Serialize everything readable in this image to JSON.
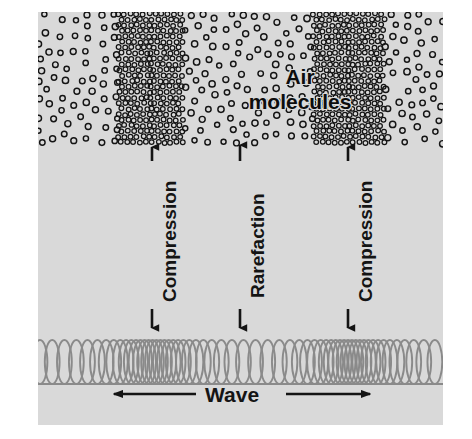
{
  "figure": {
    "background_color": "#ffffff",
    "panel_color": "#d9d9d9",
    "ink_color": "#141414",
    "coil_color": "#8a8a8a"
  },
  "labels": {
    "air": "Air",
    "molecules": "molecules",
    "compression_left": "Compression",
    "rarefaction": "Rarefaction",
    "compression_right": "Compression",
    "wave": "Wave"
  },
  "callouts": [
    {
      "name": "compression-left",
      "text": "Compression",
      "x": 152,
      "arrow_top": "up",
      "arrow_bottom": "down"
    },
    {
      "name": "rarefaction",
      "text": "Rarefaction",
      "x": 240,
      "arrow_top": "up",
      "arrow_bottom": "down"
    },
    {
      "name": "compression-right",
      "text": "Compression",
      "x": 348,
      "arrow_top": "up",
      "arrow_bottom": "down"
    }
  ],
  "chart_data": {
    "type": "diagram",
    "regions": [
      {
        "name": "rarefaction-left-edge",
        "kind": "rarefaction",
        "x_start": 0,
        "x_end": 80,
        "density": "sparse"
      },
      {
        "name": "compression-1",
        "kind": "compression",
        "x_start": 80,
        "x_end": 147,
        "density": "dense"
      },
      {
        "name": "rarefaction-center",
        "kind": "rarefaction",
        "x_start": 147,
        "x_end": 275,
        "density": "sparse"
      },
      {
        "name": "compression-2",
        "kind": "compression",
        "x_start": 275,
        "x_end": 347,
        "density": "dense"
      },
      {
        "name": "rarefaction-right-edge",
        "kind": "rarefaction",
        "x_start": 347,
        "x_end": 405,
        "density": "sparse"
      }
    ],
    "xlabel": "Wave",
    "ylabel": "",
    "legend": [
      "Compression",
      "Rarefaction",
      "Air molecules",
      "Wave"
    ]
  }
}
